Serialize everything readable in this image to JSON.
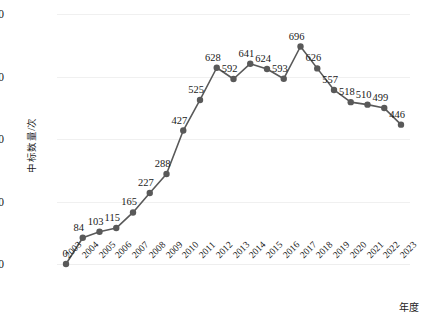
{
  "chart_data": {
    "type": "line",
    "title": "",
    "xlabel": "年度",
    "ylabel": "中标数量/次",
    "categories": [
      "2003",
      "2004",
      "2005",
      "2006",
      "2007",
      "2008",
      "2009",
      "2010",
      "2011",
      "2012",
      "2013",
      "2014",
      "2015",
      "2016",
      "2017",
      "2018",
      "2019",
      "2020",
      "2021",
      "2022",
      "2023"
    ],
    "values": [
      0,
      84,
      103,
      115,
      165,
      227,
      288,
      427,
      525,
      628,
      592,
      641,
      624,
      593,
      696,
      626,
      557,
      518,
      510,
      499,
      446
    ],
    "series": [
      {
        "name": "中标数量",
        "values": [
          0,
          84,
          103,
          115,
          165,
          227,
          288,
          427,
          525,
          628,
          592,
          641,
          624,
          593,
          696,
          626,
          557,
          518,
          510,
          499,
          446
        ]
      }
    ],
    "data_labels": [
      "0",
      "84",
      "103",
      "115",
      "165",
      "227",
      "288",
      "427",
      "525",
      "628",
      "592",
      "641",
      "624",
      "593",
      "696",
      "626",
      "557",
      "518",
      "510",
      "499",
      "446"
    ],
    "ylim": [
      0,
      800
    ],
    "yticks": [
      "0",
      "200",
      "400",
      "600",
      "800"
    ],
    "ytick_values": [
      0,
      200,
      400,
      600,
      800
    ],
    "grid": "horizontal",
    "legend": "none",
    "line_color": "#595959",
    "marker_color": "#595959",
    "marker_shape": "circle",
    "grid_color": "#f0f0f0"
  }
}
